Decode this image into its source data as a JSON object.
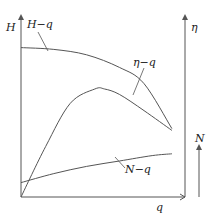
{
  "chart_data": {
    "type": "line",
    "title": "",
    "xlabel": "q",
    "ylabel_left": "H",
    "ylabel_right": "η",
    "ylabel_right_secondary": "N",
    "grid": false,
    "legend": "inline-labels",
    "xlim": [
      0,
      1
    ],
    "ylim": [
      0,
      1
    ],
    "series": [
      {
        "name": "H-q",
        "label": "H−q",
        "x": [
          0.0,
          0.2,
          0.4,
          0.6,
          0.75,
          0.92
        ],
        "y": [
          0.83,
          0.82,
          0.79,
          0.72,
          0.63,
          0.38
        ]
      },
      {
        "name": "η-q",
        "label": "η−q",
        "x": [
          0.0,
          0.15,
          0.3,
          0.45,
          0.51,
          0.6,
          0.75,
          0.92
        ],
        "y": [
          0.0,
          0.28,
          0.52,
          0.6,
          0.6,
          0.57,
          0.48,
          0.37
        ]
      },
      {
        "name": "N-q",
        "label": "N−q",
        "x": [
          0.0,
          0.2,
          0.4,
          0.6,
          0.8,
          0.92
        ],
        "y": [
          0.08,
          0.13,
          0.17,
          0.2,
          0.23,
          0.24
        ]
      }
    ],
    "annotations": [
      "H−q",
      "η−q",
      "N−q"
    ]
  }
}
